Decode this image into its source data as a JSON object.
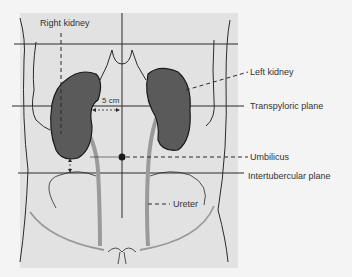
{
  "diagram": {
    "labels": {
      "right_kidney": "Right kidney",
      "left_kidney": "Left kidney",
      "transpyloric_plane": "Transpyloric plane",
      "umbilicus": "Umbilicus",
      "intertubercular_plane": "Intertubercular plane",
      "ureter": "Ureter",
      "distance": "5 cm"
    },
    "colors": {
      "background": "#f4f4f4",
      "panel": "#e2e2e2",
      "kidney_fill": "#5a5a5a",
      "ureter": "#9a9a9a",
      "line": "#2a2a2a"
    }
  }
}
